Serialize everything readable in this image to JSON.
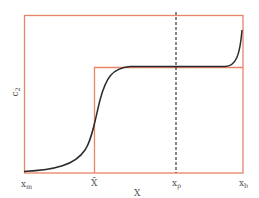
{
  "diagram": {
    "colors": {
      "frame": "#e8846a",
      "curve": "#2b2b2b",
      "dashed": "#3a3a3a",
      "text": "#555555",
      "background": "#ffffff"
    },
    "y_axis_label": {
      "main": "c",
      "sub": "2"
    },
    "x_axis_label": "X",
    "x_ticks": [
      {
        "main": "x",
        "sub": "m"
      },
      {
        "main": "X̄",
        "sub": ""
      },
      {
        "main": "x",
        "sub": "p"
      },
      {
        "main": "x",
        "sub": "b"
      }
    ]
  }
}
